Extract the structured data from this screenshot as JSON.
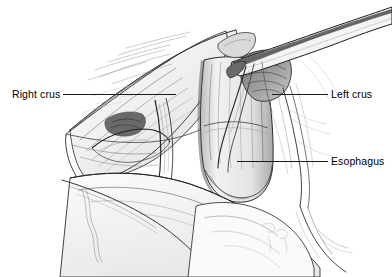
{
  "figure": {
    "style": "pen-and-ink medical illustration",
    "background_color": "#ffffff",
    "ink_color": "#1a1a1a",
    "width": 392,
    "height": 277
  },
  "labels": {
    "right_crus": "Right crus",
    "left_crus": "Left crus",
    "esophagus": "Esophagus"
  },
  "structures": [
    {
      "name": "right-crus",
      "label": "Right crus",
      "side": "left-of-image",
      "leader_from": [
        63,
        94
      ],
      "leader_to": [
        176,
        94
      ]
    },
    {
      "name": "left-crus",
      "label": "Left crus",
      "side": "right-of-image",
      "leader_from": [
        328,
        94
      ],
      "leader_to": [
        272,
        94
      ]
    },
    {
      "name": "esophagus",
      "label": "Esophagus",
      "side": "right-of-image",
      "leader_from": [
        328,
        161
      ],
      "leader_to": [
        237,
        161
      ]
    },
    {
      "name": "retractor-instrument",
      "label": "",
      "side": "upper-right",
      "leader_from": null,
      "leader_to": null
    }
  ]
}
